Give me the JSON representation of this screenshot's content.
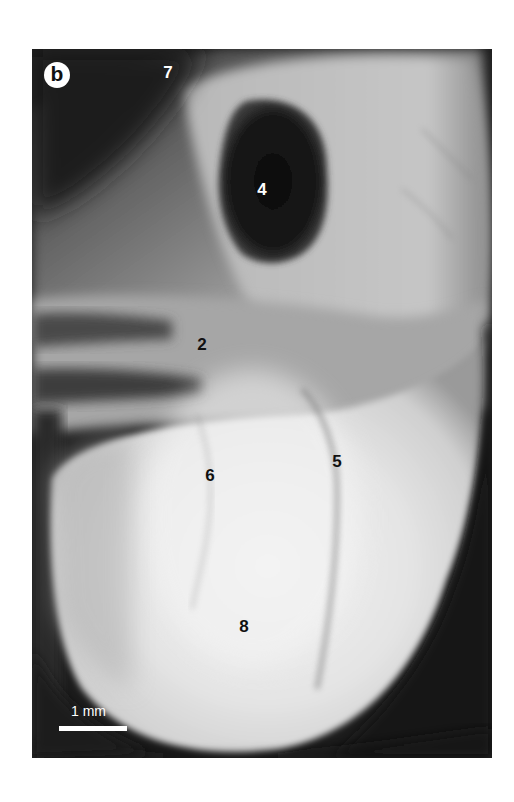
{
  "figure": {
    "panel_label": "b",
    "scale_bar": {
      "label": "1 mm"
    },
    "annotations": [
      {
        "id": "7",
        "text": "7",
        "tone": "light"
      },
      {
        "id": "4",
        "text": "4",
        "tone": "light"
      },
      {
        "id": "2",
        "text": "2",
        "tone": "dark"
      },
      {
        "id": "6",
        "text": "6",
        "tone": "dark"
      },
      {
        "id": "5",
        "text": "5",
        "tone": "dark"
      },
      {
        "id": "8",
        "text": "8",
        "tone": "dark"
      }
    ],
    "colors": {
      "background": "#ffffff",
      "photo_dark": "#1a1a1a",
      "tissue_light": "#e8e8e8",
      "tissue_mid": "#a8a8a8",
      "label_light": "#ffffff",
      "label_dark": "#111111"
    }
  }
}
